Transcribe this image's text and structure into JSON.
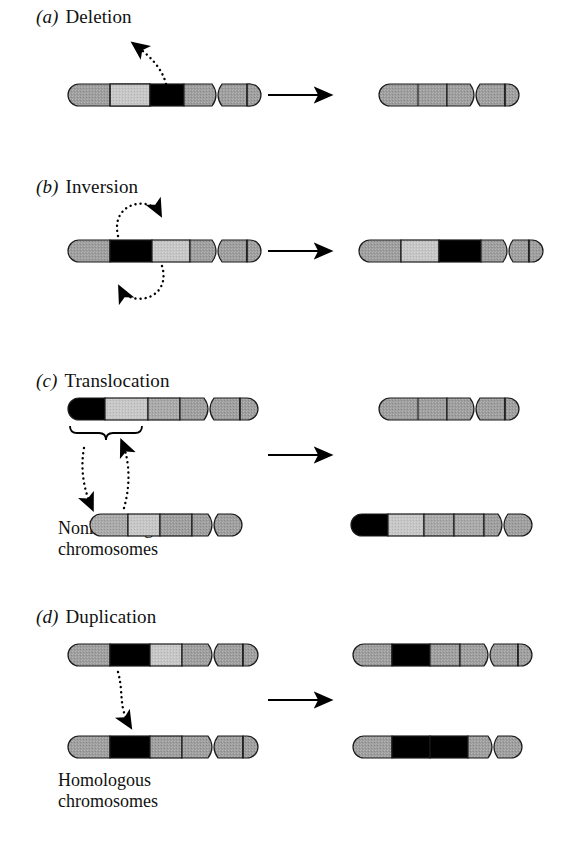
{
  "figure": {
    "title_style": "lettered-panels",
    "colors": {
      "chromosome_gray": "#9a9a9a",
      "chromosome_gray_light": "#c2c2c2",
      "chromosome_gray_mid": "#a8a8a8",
      "band_black": "#000000",
      "outline": "#1a1a1a",
      "arrow": "#000000",
      "background": "#ffffff",
      "text": "#111111"
    }
  },
  "panels": [
    {
      "id": "a",
      "label": "(a)",
      "name": "Deletion",
      "description": "A chromosome segment is lost from the chromosome",
      "before": {
        "chromosome": {
          "name": "chromosome-with-deleted-band",
          "segments": [
            "gray",
            "gray-light",
            "black",
            "gray",
            "centromere",
            "gray",
            "gray"
          ]
        }
      },
      "after": {
        "chromosome": {
          "name": "shortened-chromosome",
          "segments": [
            "gray",
            "gray",
            "gray",
            "centromere",
            "gray",
            "gray"
          ]
        }
      },
      "annotation": {
        "arrow": "dotted-arrow-up-right",
        "meaning": "deleted segment leaves the chromosome"
      }
    },
    {
      "id": "b",
      "label": "(b)",
      "name": "Inversion",
      "description": "A chromosome segment is reversed end to end",
      "before": {
        "chromosome": {
          "name": "chromosome-before-inversion",
          "segments": [
            "gray",
            "black",
            "gray-light",
            "gray",
            "centromere",
            "gray",
            "gray"
          ]
        }
      },
      "after": {
        "chromosome": {
          "name": "chromosome-after-inversion",
          "segments": [
            "gray",
            "gray-light",
            "black",
            "gray",
            "centromere",
            "gray",
            "gray"
          ]
        }
      },
      "annotation": {
        "arrow": "dotted-rotation-loops",
        "meaning": "segment rotates 180 degrees"
      }
    },
    {
      "id": "c",
      "label": "(c)",
      "name": "Translocation",
      "description": "A segment moves to a nonhomologous chromosome",
      "caption": "Nonhomologous\nchromosomes",
      "before": {
        "chromosome_top": {
          "name": "donor-chromosome",
          "segments": [
            "black",
            "gray-light",
            "gray",
            "gray",
            "centromere",
            "gray",
            "gray"
          ]
        },
        "chromosome_bottom": {
          "name": "recipient-chromosome",
          "segments": [
            "gray",
            "gray-light",
            "gray",
            "gray",
            "centromere",
            "gray"
          ]
        }
      },
      "after": {
        "chromosome_top": {
          "name": "donor-chromosome-after",
          "segments": [
            "gray",
            "gray",
            "gray",
            "centromere",
            "gray",
            "gray"
          ]
        },
        "chromosome_bottom": {
          "name": "recipient-chromosome-after",
          "segments": [
            "black",
            "gray-light",
            "gray",
            "gray",
            "gray",
            "centromere",
            "gray"
          ]
        }
      },
      "annotation": {
        "brace": "segment-brace",
        "arrows": [
          "dotted-arrow-down-left",
          "dotted-arrow-up-right"
        ],
        "meaning": "segments exchange between nonhomologous chromosomes"
      }
    },
    {
      "id": "d",
      "label": "(d)",
      "name": "Duplication",
      "description": "A segment is copied onto the homologous chromosome",
      "caption": "Homologous\nchromosomes",
      "before": {
        "chromosome_top": {
          "name": "donor-homolog",
          "segments": [
            "gray",
            "black",
            "gray-light",
            "gray",
            "centromere",
            "gray",
            "gray"
          ]
        },
        "chromosome_bottom": {
          "name": "recipient-homolog",
          "segments": [
            "gray",
            "black",
            "gray",
            "gray",
            "centromere",
            "gray",
            "gray"
          ]
        }
      },
      "after": {
        "chromosome_top": {
          "name": "donor-homolog-after",
          "segments": [
            "gray",
            "black",
            "gray",
            "gray",
            "centromere",
            "gray",
            "gray"
          ]
        },
        "chromosome_bottom": {
          "name": "recipient-homolog-after",
          "segments": [
            "gray",
            "black",
            "black",
            "gray",
            "centromere",
            "gray"
          ]
        }
      },
      "annotation": {
        "arrow": "dotted-arrow-down",
        "meaning": "segment is duplicated onto the homolog"
      }
    }
  ],
  "transform_arrows": [
    {
      "name": "transform-arrow-a",
      "panel": "a"
    },
    {
      "name": "transform-arrow-b",
      "panel": "b"
    },
    {
      "name": "transform-arrow-c",
      "panel": "c"
    },
    {
      "name": "transform-arrow-d",
      "panel": "d"
    }
  ]
}
